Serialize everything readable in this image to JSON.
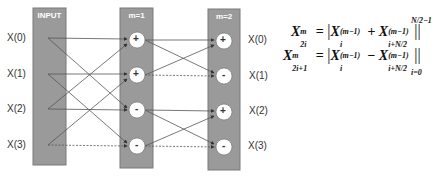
{
  "diagram": {
    "type": "butterfly-network",
    "colors": {
      "stage_fill": "#9a9a9a",
      "stage_stroke": "#7a7a7a",
      "line": "#555555",
      "node_fill": "#ffffff",
      "text": "#333333"
    },
    "stages": [
      {
        "title": "INPUT",
        "x": 33,
        "width": 33
      },
      {
        "title": "m=1",
        "x": 120,
        "width": 33
      },
      {
        "title": "m=2",
        "x": 208,
        "width": 32
      }
    ],
    "input_labels": [
      "X(0)",
      "X(1)",
      "X(2)",
      "X(3)"
    ],
    "output_labels": [
      "X(0)",
      "X(1)",
      "X(2)",
      "X(3)"
    ],
    "m1_nodes": [
      "+",
      "+",
      "-",
      "-"
    ],
    "m2_nodes": [
      "+",
      "-",
      "+",
      "-"
    ],
    "input_connections": [
      [
        0,
        0
      ],
      [
        0,
        2
      ],
      [
        1,
        1
      ],
      [
        1,
        3
      ],
      [
        2,
        2
      ],
      [
        2,
        0
      ],
      [
        3,
        3
      ],
      [
        3,
        1
      ]
    ],
    "m1_connections": [
      [
        0,
        0
      ],
      [
        0,
        1
      ],
      [
        1,
        1
      ],
      [
        1,
        0
      ],
      [
        2,
        2
      ],
      [
        2,
        3
      ],
      [
        3,
        3
      ],
      [
        3,
        2
      ]
    ]
  },
  "formula": {
    "line1_lhs": "X",
    "line1_lhs_sup": "m",
    "line1_lhs_sub": "2i",
    "line1_rhs_a": "X",
    "line1_rhs_a_sup": "(m−1)",
    "line1_rhs_a_sub": "i",
    "line1_op": "+",
    "line1_rhs_b": "X",
    "line1_rhs_b_sup": "(m−1)",
    "line1_rhs_b_sub": "i+N/2",
    "line2_lhs": "X",
    "line2_lhs_sup": "m",
    "line2_lhs_sub": "2i+1",
    "line2_rhs_a": "X",
    "line2_rhs_a_sup": "(m−1)",
    "line2_rhs_a_sub": "i",
    "line2_op": "−",
    "line2_rhs_b": "X",
    "line2_rhs_b_sup": "(m−1)",
    "line2_rhs_b_sub": "i+N/2",
    "eq": "=",
    "upper_limit": "N/2−1",
    "lower_limit": "i=0"
  }
}
